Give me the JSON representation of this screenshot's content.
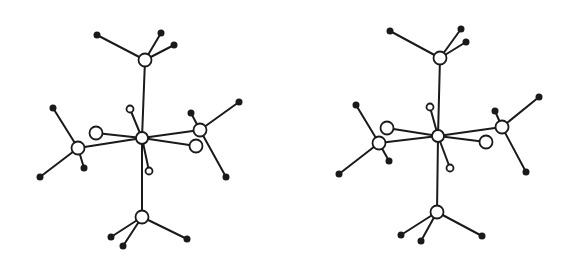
{
  "figure": {
    "type": "stereo-pair molecular structure",
    "colors": {
      "ink": "#1a1a1a",
      "background": "#ffffff"
    },
    "views": [
      {
        "name": "left",
        "atoms": [
          {
            "id": "M",
            "x": 142,
            "y": 138,
            "r": 6,
            "kind": "open"
          },
          {
            "id": "P1",
            "x": 145,
            "y": 60,
            "r": 6.5,
            "kind": "open"
          },
          {
            "id": "P2",
            "x": 78,
            "y": 148,
            "r": 6.5,
            "kind": "open"
          },
          {
            "id": "P3",
            "x": 200,
            "y": 130,
            "r": 6.5,
            "kind": "open"
          },
          {
            "id": "P4",
            "x": 142,
            "y": 217,
            "r": 6.5,
            "kind": "open"
          },
          {
            "id": "L1",
            "x": 96,
            "y": 133,
            "r": 6.5,
            "kind": "open"
          },
          {
            "id": "L2",
            "x": 196,
            "y": 146,
            "r": 6.5,
            "kind": "open"
          },
          {
            "id": "H1",
            "x": 130,
            "y": 109,
            "r": 3.5,
            "kind": "open"
          },
          {
            "id": "H2",
            "x": 149,
            "y": 171,
            "r": 3.5,
            "kind": "open"
          },
          {
            "id": "C1a",
            "x": 97,
            "y": 35,
            "r": 3.5,
            "kind": "dot"
          },
          {
            "id": "C1b",
            "x": 161,
            "y": 33,
            "r": 3.5,
            "kind": "dot"
          },
          {
            "id": "C1c",
            "x": 174,
            "y": 45,
            "r": 3.5,
            "kind": "dot"
          },
          {
            "id": "C2a",
            "x": 53,
            "y": 108,
            "r": 3.5,
            "kind": "dot"
          },
          {
            "id": "C2b",
            "x": 40,
            "y": 177,
            "r": 3.5,
            "kind": "dot"
          },
          {
            "id": "C2c",
            "x": 84,
            "y": 168,
            "r": 3.5,
            "kind": "dot"
          },
          {
            "id": "C3a",
            "x": 191,
            "y": 113,
            "r": 3.5,
            "kind": "dot"
          },
          {
            "id": "C3b",
            "x": 239,
            "y": 102,
            "r": 3.5,
            "kind": "dot"
          },
          {
            "id": "C3c",
            "x": 226,
            "y": 177,
            "r": 3.5,
            "kind": "dot"
          },
          {
            "id": "C4a",
            "x": 111,
            "y": 237,
            "r": 3.5,
            "kind": "dot"
          },
          {
            "id": "C4b",
            "x": 123,
            "y": 246,
            "r": 3.5,
            "kind": "dot"
          },
          {
            "id": "C4c",
            "x": 187,
            "y": 239,
            "r": 3.5,
            "kind": "dot"
          }
        ]
      },
      {
        "name": "right",
        "atoms": [
          {
            "id": "M",
            "x": 438,
            "y": 136,
            "r": 6,
            "kind": "open"
          },
          {
            "id": "P1",
            "x": 440,
            "y": 58,
            "r": 6.5,
            "kind": "open"
          },
          {
            "id": "P2",
            "x": 379,
            "y": 143,
            "r": 6.5,
            "kind": "open"
          },
          {
            "id": "P3",
            "x": 502,
            "y": 127,
            "r": 6.5,
            "kind": "open"
          },
          {
            "id": "P4",
            "x": 437,
            "y": 212,
            "r": 6.5,
            "kind": "open"
          },
          {
            "id": "L1",
            "x": 387,
            "y": 128,
            "r": 6.5,
            "kind": "open"
          },
          {
            "id": "L2",
            "x": 486,
            "y": 142,
            "r": 6.5,
            "kind": "open"
          },
          {
            "id": "H1",
            "x": 430,
            "y": 107,
            "r": 3.5,
            "kind": "open"
          },
          {
            "id": "H2",
            "x": 450,
            "y": 168,
            "r": 3.5,
            "kind": "open"
          },
          {
            "id": "C1a",
            "x": 390,
            "y": 31,
            "r": 3.5,
            "kind": "dot"
          },
          {
            "id": "C1b",
            "x": 461,
            "y": 29,
            "r": 3.5,
            "kind": "dot"
          },
          {
            "id": "C1c",
            "x": 466,
            "y": 42,
            "r": 3.5,
            "kind": "dot"
          },
          {
            "id": "C2a",
            "x": 356,
            "y": 105,
            "r": 3.5,
            "kind": "dot"
          },
          {
            "id": "C2b",
            "x": 339,
            "y": 174,
            "r": 3.5,
            "kind": "dot"
          },
          {
            "id": "C2c",
            "x": 389,
            "y": 161,
            "r": 3.5,
            "kind": "dot"
          },
          {
            "id": "C3a",
            "x": 495,
            "y": 111,
            "r": 3.5,
            "kind": "dot"
          },
          {
            "id": "C3b",
            "x": 539,
            "y": 97,
            "r": 3.5,
            "kind": "dot"
          },
          {
            "id": "C3c",
            "x": 526,
            "y": 172,
            "r": 3.5,
            "kind": "dot"
          },
          {
            "id": "C4a",
            "x": 401,
            "y": 235,
            "r": 3.5,
            "kind": "dot"
          },
          {
            "id": "C4b",
            "x": 421,
            "y": 241,
            "r": 3.5,
            "kind": "dot"
          },
          {
            "id": "C4c",
            "x": 482,
            "y": 236,
            "r": 3.5,
            "kind": "dot"
          }
        ]
      }
    ],
    "bonds": [
      [
        "M",
        "P1"
      ],
      [
        "M",
        "P2"
      ],
      [
        "M",
        "P3"
      ],
      [
        "M",
        "P4"
      ],
      [
        "M",
        "L1"
      ],
      [
        "M",
        "L2"
      ],
      [
        "M",
        "H1"
      ],
      [
        "M",
        "H2"
      ],
      [
        "P1",
        "C1a"
      ],
      [
        "P1",
        "C1b"
      ],
      [
        "P1",
        "C1c"
      ],
      [
        "P2",
        "C2a"
      ],
      [
        "P2",
        "C2b"
      ],
      [
        "P2",
        "C2c"
      ],
      [
        "P3",
        "C3a"
      ],
      [
        "P3",
        "C3b"
      ],
      [
        "P3",
        "C3c"
      ],
      [
        "P4",
        "C4a"
      ],
      [
        "P4",
        "C4b"
      ],
      [
        "P4",
        "C4c"
      ]
    ]
  }
}
